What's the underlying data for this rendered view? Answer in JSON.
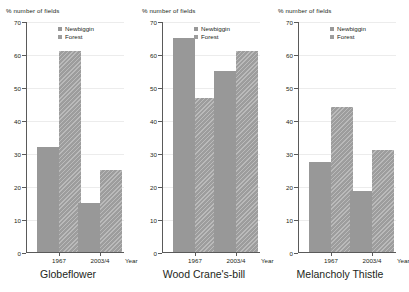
{
  "chart_data": [
    {
      "type": "bar",
      "title": "Globeflower",
      "xlabel": "Year",
      "ylabel": "% number of fields",
      "ylim": [
        0,
        70
      ],
      "yticks": [
        0,
        10,
        20,
        30,
        40,
        50,
        60,
        70
      ],
      "grid": true,
      "legend_position": "top-right",
      "categories": [
        "1967",
        "2003/4"
      ],
      "series": [
        {
          "name": "Newbiggin",
          "values": [
            31.8,
            14.8
          ]
        },
        {
          "name": "Forest",
          "values": [
            60.8,
            24.8
          ]
        }
      ]
    },
    {
      "type": "bar",
      "title": "Wood Crane's-bill",
      "xlabel": "Year",
      "ylabel": "% number of fields",
      "ylim": [
        0,
        70
      ],
      "yticks": [
        0,
        10,
        20,
        30,
        40,
        50,
        60,
        70
      ],
      "grid": true,
      "legend_position": "top-right",
      "categories": [
        "1967",
        "2003/4"
      ],
      "series": [
        {
          "name": "Newbiggin",
          "values": [
            65.0,
            55.0
          ]
        },
        {
          "name": "Forest",
          "values": [
            46.7,
            61.0
          ]
        }
      ]
    },
    {
      "type": "bar",
      "title": "Melancholy Thistle",
      "xlabel": "Year",
      "ylabel": "% number of fields",
      "ylim": [
        0,
        70
      ],
      "yticks": [
        0,
        10,
        20,
        30,
        40,
        50,
        60,
        70
      ],
      "grid": true,
      "legend_position": "top-right",
      "categories": [
        "1967",
        "2003/4"
      ],
      "series": [
        {
          "name": "Newbiggin",
          "values": [
            27.3,
            18.5
          ]
        },
        {
          "name": "Forest",
          "values": [
            44.0,
            31.0
          ]
        }
      ]
    }
  ],
  "style": {
    "bar_color": "#989898",
    "hatch_color": "#9d9d9d",
    "axis_color": "#5a5a5a",
    "grid_color": "#ececec",
    "text_color": "#231f20",
    "background": "#ffffff"
  },
  "panels": [
    {
      "ylabel": "% number of fields",
      "title": "Globeflower",
      "xaxis_name": "Year",
      "legend": [
        {
          "label": "Newbiggin",
          "swatch": "solid-square-icon"
        },
        {
          "label": "Forest",
          "swatch": "hatched-square-icon"
        }
      ],
      "yticks": [
        {
          "label": "70"
        },
        {
          "label": "60"
        },
        {
          "label": "50"
        },
        {
          "label": "40"
        },
        {
          "label": "30"
        },
        {
          "label": "20"
        },
        {
          "label": "10"
        },
        {
          "label": "0"
        }
      ],
      "categories": [
        {
          "label": "1967"
        },
        {
          "label": "2003/4"
        }
      ],
      "bars": [
        {
          "series": "Newbiggin",
          "category": "1967",
          "value": 31.8
        },
        {
          "series": "Forest",
          "category": "1967",
          "value": 60.8
        },
        {
          "series": "Newbiggin",
          "category": "2003/4",
          "value": 14.8
        },
        {
          "series": "Forest",
          "category": "2003/4",
          "value": 24.8
        }
      ]
    },
    {
      "ylabel": "% number of fields",
      "title": "Wood Crane's-bill",
      "xaxis_name": "Year",
      "legend": [
        {
          "label": "Newbiggin",
          "swatch": "solid-square-icon"
        },
        {
          "label": "Forest",
          "swatch": "hatched-square-icon"
        }
      ],
      "yticks": [
        {
          "label": "70"
        },
        {
          "label": "60"
        },
        {
          "label": "50"
        },
        {
          "label": "40"
        },
        {
          "label": "30"
        },
        {
          "label": "20"
        },
        {
          "label": "10"
        },
        {
          "label": "0"
        }
      ],
      "categories": [
        {
          "label": "1967"
        },
        {
          "label": "2003/4"
        }
      ],
      "bars": [
        {
          "series": "Newbiggin",
          "category": "1967",
          "value": 65.0
        },
        {
          "series": "Forest",
          "category": "1967",
          "value": 46.7
        },
        {
          "series": "Newbiggin",
          "category": "2003/4",
          "value": 55.0
        },
        {
          "series": "Forest",
          "category": "2003/4",
          "value": 61.0
        }
      ]
    },
    {
      "ylabel": "% number of fields",
      "title": "Melancholy Thistle",
      "xaxis_name": "Year",
      "legend": [
        {
          "label": "Newbiggin",
          "swatch": "solid-square-icon"
        },
        {
          "label": "Forest",
          "swatch": "hatched-square-icon"
        }
      ],
      "yticks": [
        {
          "label": "70"
        },
        {
          "label": "60"
        },
        {
          "label": "50"
        },
        {
          "label": "40"
        },
        {
          "label": "30"
        },
        {
          "label": "20"
        },
        {
          "label": "10"
        },
        {
          "label": "0"
        }
      ],
      "categories": [
        {
          "label": "1967"
        },
        {
          "label": "2003/4"
        }
      ],
      "bars": [
        {
          "series": "Newbiggin",
          "category": "1967",
          "value": 27.3
        },
        {
          "series": "Forest",
          "category": "1967",
          "value": 44.0
        },
        {
          "series": "Newbiggin",
          "category": "2003/4",
          "value": 18.5
        },
        {
          "series": "Forest",
          "category": "2003/4",
          "value": 31.0
        }
      ]
    }
  ]
}
